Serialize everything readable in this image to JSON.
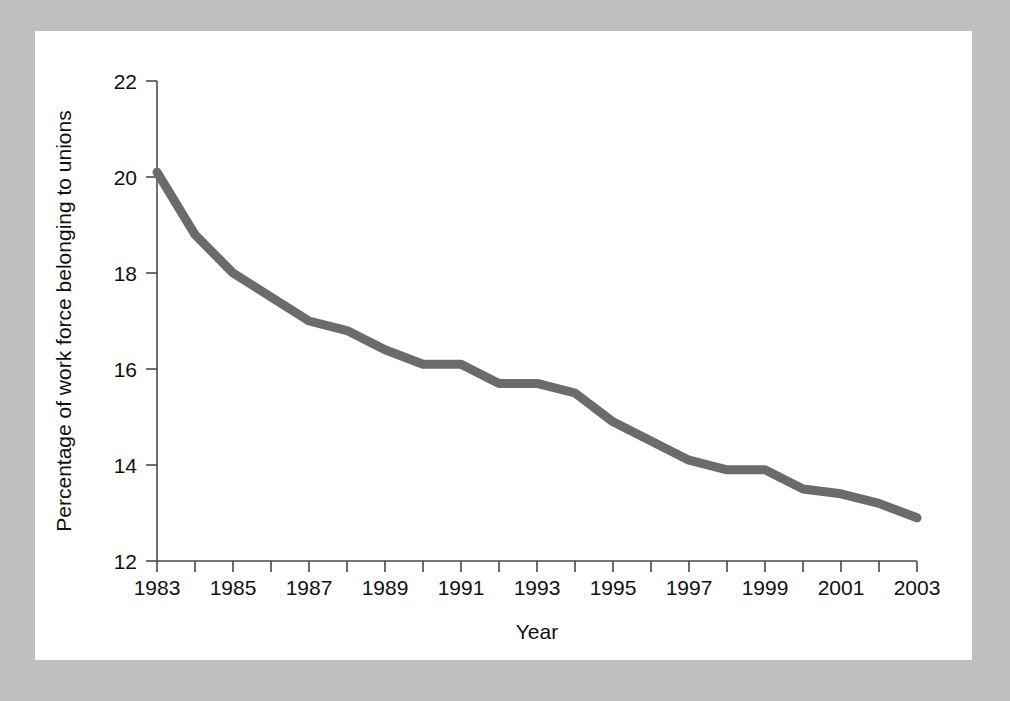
{
  "figure": {
    "background_color": "#bfbfbf",
    "card_color": "#ffffff",
    "axis_color": "#4a4a4a",
    "text_color": "#111111"
  },
  "chart_data": {
    "type": "line",
    "title": "",
    "subtitle": "",
    "xlabel": "Year",
    "ylabel": "Percentage of work force belonging to unions",
    "x": [
      1983,
      1984,
      1985,
      1986,
      1987,
      1988,
      1989,
      1990,
      1991,
      1992,
      1993,
      1994,
      1995,
      1996,
      1997,
      1998,
      1999,
      2000,
      2001,
      2002,
      2003
    ],
    "values": [
      20.1,
      18.8,
      18.0,
      17.5,
      17.0,
      16.8,
      16.4,
      16.1,
      16.1,
      15.7,
      15.7,
      15.5,
      14.9,
      14.5,
      14.1,
      13.9,
      13.9,
      13.5,
      13.4,
      13.2,
      12.9
    ],
    "series": [
      {
        "name": "Percentage of work force belonging to unions",
        "color": "#6b6b6b",
        "line_width": 9,
        "values": [
          20.1,
          18.8,
          18.0,
          17.5,
          17.0,
          16.8,
          16.4,
          16.1,
          16.1,
          15.7,
          15.7,
          15.5,
          14.9,
          14.5,
          14.1,
          13.9,
          13.9,
          13.5,
          13.4,
          13.2,
          12.9
        ]
      }
    ],
    "xlim": [
      1983,
      2003
    ],
    "ylim": [
      12,
      22
    ],
    "y_ticks": [
      12,
      14,
      16,
      18,
      20,
      22
    ],
    "y_tick_labels": [
      "12",
      "14",
      "16",
      "18",
      "20",
      "22"
    ],
    "x_ticks": [
      1983,
      1984,
      1985,
      1986,
      1987,
      1988,
      1989,
      1990,
      1991,
      1992,
      1993,
      1994,
      1995,
      1996,
      1997,
      1998,
      1999,
      2000,
      2001,
      2002,
      2003
    ],
    "x_tick_labels_shown": [
      "1983",
      "1985",
      "1987",
      "1989",
      "1991",
      "1993",
      "1995",
      "1997",
      "1999",
      "2001",
      "2003"
    ],
    "x_tick_label_step": 2,
    "grid": false,
    "legend": false,
    "legend_position": "none",
    "annotations": []
  }
}
